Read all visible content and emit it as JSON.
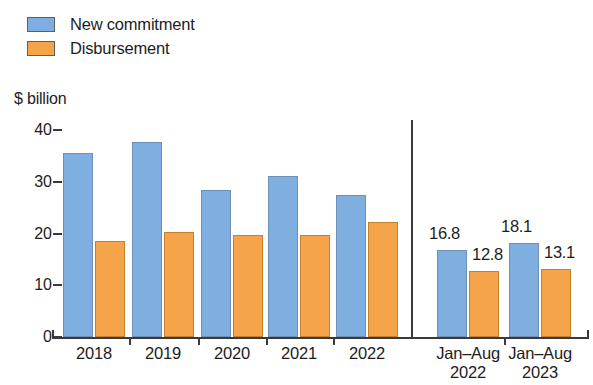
{
  "legend": {
    "items": [
      {
        "label": "New commitment",
        "color": "#7FAEE0",
        "icon": "blue-square-swatch"
      },
      {
        "label": "Disbursement",
        "color": "#F5A449",
        "icon": "orange-square-swatch"
      }
    ]
  },
  "axis": {
    "y_title": "$ billion",
    "ticks": [
      "0",
      "10",
      "20",
      "30",
      "40"
    ]
  },
  "groups": [
    {
      "label_line1": "2018",
      "label_line2": ""
    },
    {
      "label_line1": "2019",
      "label_line2": ""
    },
    {
      "label_line1": "2020",
      "label_line2": ""
    },
    {
      "label_line1": "2021",
      "label_line2": ""
    },
    {
      "label_line1": "2022",
      "label_line2": ""
    },
    {
      "label_line1": "Jan–Aug",
      "label_line2": "2022"
    },
    {
      "label_line1": "Jan–Aug",
      "label_line2": "2023"
    }
  ],
  "data_labels": {
    "janaug2022_new": "16.8",
    "janaug2022_disb": "12.8",
    "janaug2023_new": "18.1",
    "janaug2023_disb": "13.1"
  },
  "chart_data": {
    "type": "bar",
    "title": "",
    "subtitle": "",
    "xlabel": "",
    "ylabel": "$ billion",
    "ylim": [
      0,
      40
    ],
    "yticks": [
      0,
      10,
      20,
      30,
      40
    ],
    "grid": false,
    "legend_position": "top-left",
    "categories": [
      "2018",
      "2019",
      "2020",
      "2021",
      "2022",
      "Jan–Aug 2022",
      "Jan–Aug 2023"
    ],
    "series": [
      {
        "name": "New commitment",
        "color": "#7FAEE0",
        "values": [
          35.5,
          37.6,
          28.4,
          31.1,
          27.5,
          16.8,
          18.1
        ],
        "labelled_points": {
          "Jan–Aug 2022": "16.8",
          "Jan–Aug 2023": "18.1"
        }
      },
      {
        "name": "Disbursement",
        "color": "#F5A449",
        "values": [
          18.6,
          20.2,
          19.8,
          19.7,
          22.2,
          12.8,
          13.1
        ],
        "labelled_points": {
          "Jan–Aug 2022": "12.8",
          "Jan–Aug 2023": "13.1"
        }
      }
    ],
    "annotations": [
      {
        "type": "vertical-separator",
        "after_category": "2022"
      }
    ]
  }
}
